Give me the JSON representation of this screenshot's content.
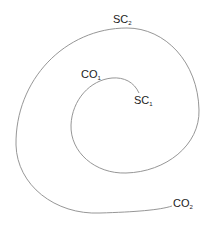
{
  "diagram": {
    "type": "spiral",
    "stroke_color": "#8a8a8a",
    "labels": {
      "sc2": {
        "base": "SC",
        "sub": "2"
      },
      "co1": {
        "base": "CO",
        "sub": "1"
      },
      "sc1": {
        "base": "SC",
        "sub": "1"
      },
      "co2": {
        "base": "CO",
        "sub": "2"
      }
    }
  }
}
